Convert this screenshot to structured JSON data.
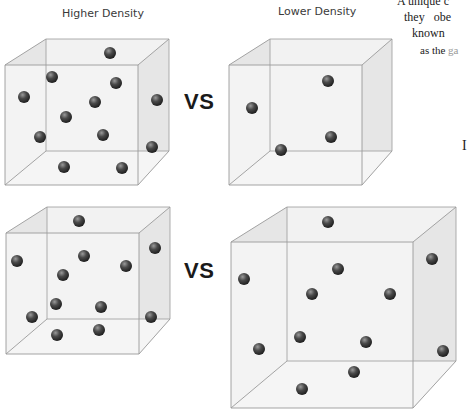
{
  "labels": {
    "left": "Higher Density",
    "right": "Lower Density",
    "vs_top": "VS",
    "vs_bottom": "VS"
  },
  "side_text": {
    "line1": "A unique c",
    "line2": "they  obe",
    "line3": "known",
    "line4_a": "as the ",
    "line4_b": "ga",
    "fragment": "I"
  },
  "colors": {
    "cube_edge": "#9a9a9a",
    "cube_face": "#f2f2f2",
    "cube_side_shade": "#e6e6e6",
    "sphere_dark": "#2a2a2a",
    "sphere_light": "#8a8a8a",
    "text": "#3a3a3a"
  },
  "comparisons": [
    {
      "row": "top",
      "left": {
        "density": "higher",
        "sphere_count": 12
      },
      "right": {
        "density": "lower",
        "sphere_count": 4
      }
    },
    {
      "row": "bottom",
      "left": {
        "density": "higher",
        "sphere_count": 12
      },
      "right": {
        "density": "lower",
        "sphere_count": 12
      }
    }
  ]
}
